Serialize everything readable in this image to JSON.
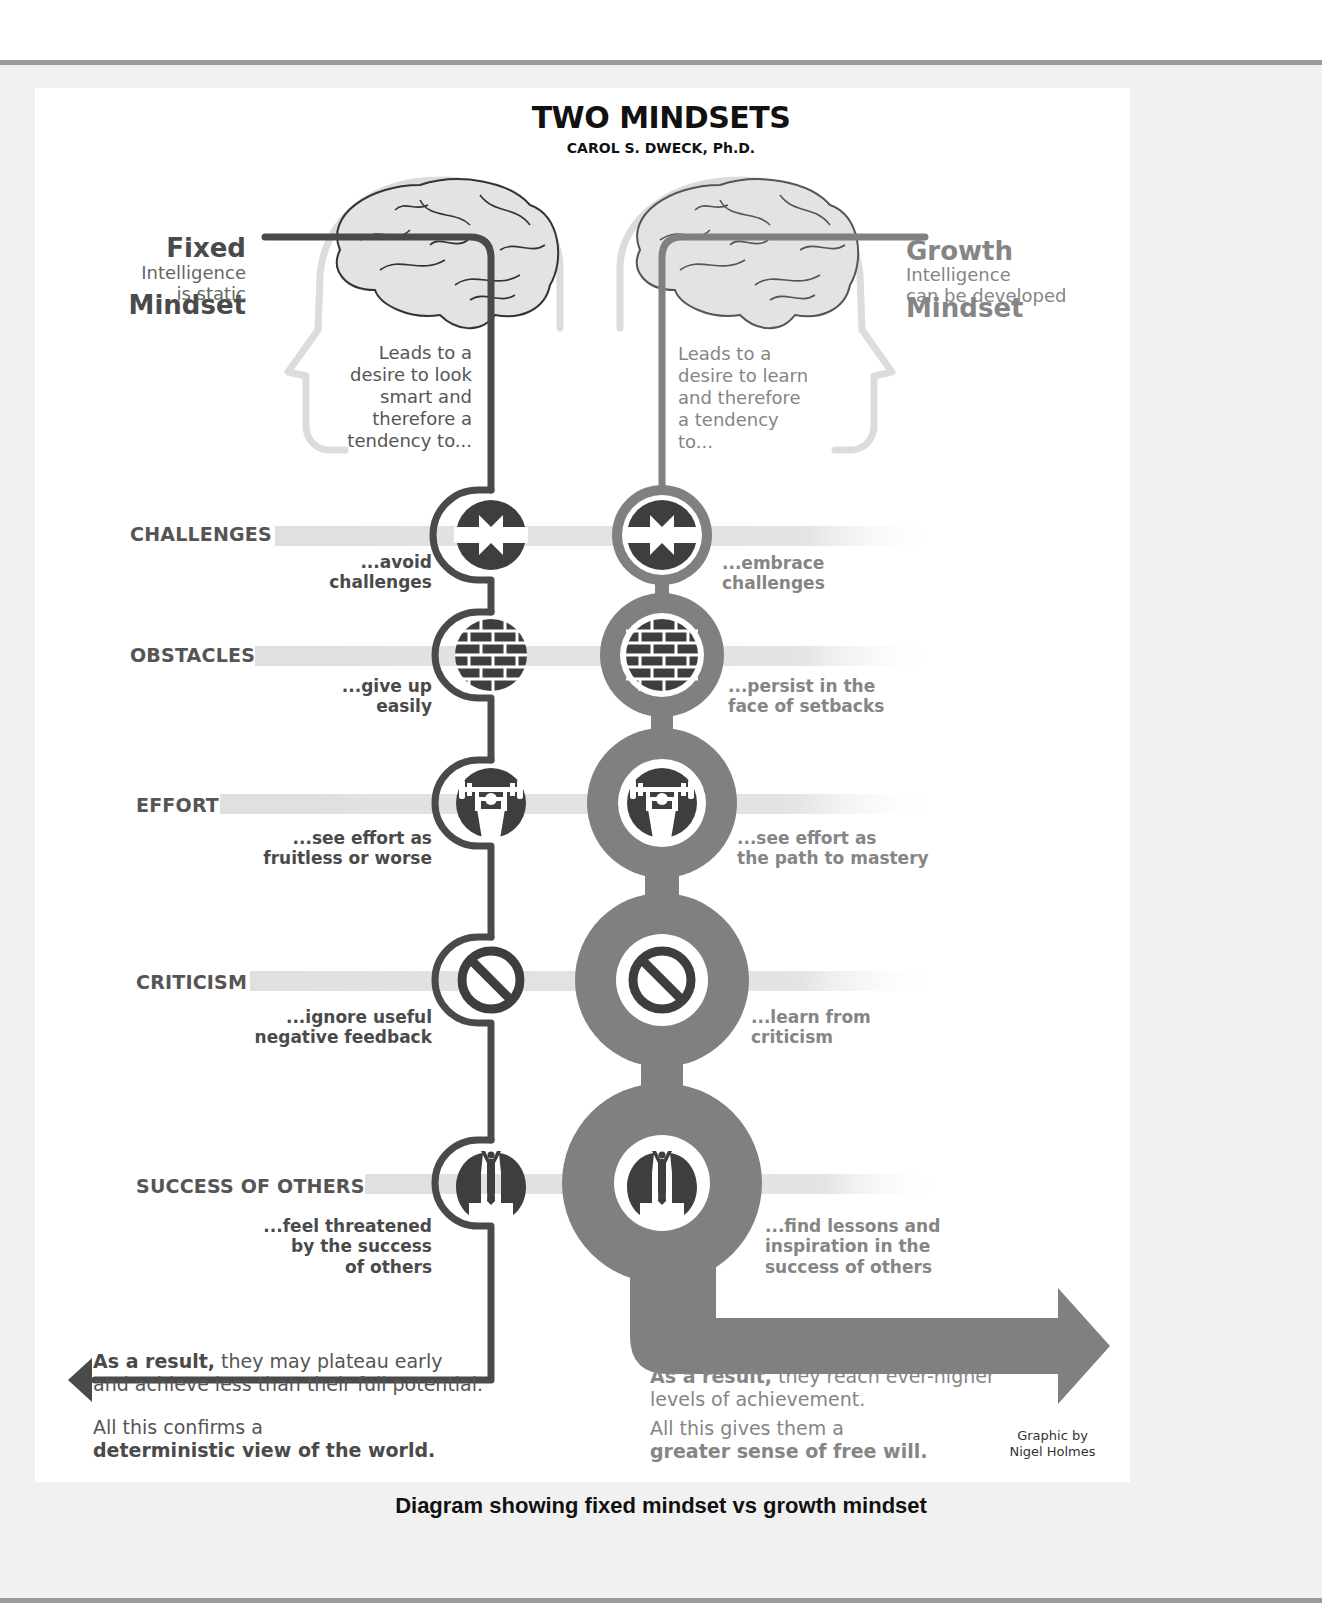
{
  "colors": {
    "fixed_line": "#4a4a4a",
    "growth_line": "#808080",
    "band": "#e2e2e2",
    "icon_fill": "#3e3e3e",
    "head_outline": "#dcdcdc",
    "page_background": "#f1f1f1",
    "rule": "#9a9a9a"
  },
  "header": {
    "title": "TWO MINDSETS",
    "subtitle": "CAROL S. DWECK, Ph.D."
  },
  "fixed": {
    "name_line1": "Fixed",
    "name_line2": "Mindset",
    "desc": "Intelligence\nis static",
    "leads_to": "Leads to a\ndesire to look\nsmart and\ntherefore a\ntendency to...",
    "result_bold": "As a result,",
    "result_text": " they may plateau early\nand achieve less than their full potential.",
    "conclusion_plain": "All this confirms a",
    "conclusion_bold": "deterministic view of the world."
  },
  "growth": {
    "name_line1": "Growth",
    "name_line2": "Mindset",
    "desc": "Intelligence\ncan be developed",
    "leads_to": "Leads to a\ndesire to learn\nand therefore\na tendency\nto...",
    "result_bold": "As a result,",
    "result_text": " they reach ever-higher\nlevels of achievement.",
    "conclusion_plain": "All this gives them a",
    "conclusion_bold": "greater sense of free will."
  },
  "categories": [
    {
      "label": "CHALLENGES",
      "icon": "arrows-inward-icon",
      "fixed": "...avoid\nchallenges",
      "growth": "...embrace\nchallenges"
    },
    {
      "label": "OBSTACLES",
      "icon": "brick-wall-icon",
      "fixed": "...give up\neasily",
      "growth": "...persist in the\nface of setbacks"
    },
    {
      "label": "EFFORT",
      "icon": "weightlifter-icon",
      "fixed": "...see effort as\nfruitless or worse",
      "growth": "...see effort as\nthe path to mastery"
    },
    {
      "label": "CRITICISM",
      "icon": "prohibited-icon",
      "fixed": "...ignore useful\nnegative feedback",
      "growth": "...learn from\ncriticism"
    },
    {
      "label": "SUCCESS OF OTHERS",
      "icon": "winner-podium-icon",
      "fixed": "...feel threatened\nby the success\nof others",
      "growth": "...find lessons and\ninspiration in the\nsuccess of others"
    }
  ],
  "credit": "Graphic by\nNigel Holmes",
  "caption": "Diagram showing fixed mindset vs growth mindset"
}
